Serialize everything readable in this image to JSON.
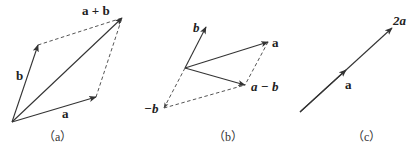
{
  "figure": {
    "panels": [
      {
        "id": "a",
        "caption": "（a）",
        "labels": {
          "a": "a",
          "b": "b",
          "sum": "a + b"
        },
        "vectors": [
          {
            "name": "a",
            "from": [
              12,
              122
            ],
            "to": [
              96,
              97
            ],
            "style": "solid"
          },
          {
            "name": "b",
            "from": [
              12,
              122
            ],
            "to": [
              38,
              45
            ],
            "style": "solid"
          },
          {
            "name": "a+b",
            "from": [
              12,
              122
            ],
            "to": [
              122,
              18
            ],
            "style": "solid"
          }
        ],
        "dashed": [
          {
            "from": [
              38,
              45
            ],
            "to": [
              122,
              18
            ]
          },
          {
            "from": [
              96,
              97
            ],
            "to": [
              122,
              18
            ]
          }
        ]
      },
      {
        "id": "b",
        "caption": "（b）",
        "labels": {
          "a": "a",
          "b": "b",
          "neg_b": "−b",
          "diff": "a − b"
        },
        "vectors": [
          {
            "name": "b",
            "from": [
              185,
              68
            ],
            "to": [
              206,
              27
            ],
            "style": "solid"
          },
          {
            "name": "a",
            "from": [
              185,
              68
            ],
            "to": [
              268,
              42
            ],
            "style": "solid"
          },
          {
            "name": "a-b",
            "from": [
              185,
              68
            ],
            "to": [
              245,
              85
            ],
            "style": "solid"
          },
          {
            "name": "-b",
            "from": [
              185,
              68
            ],
            "to": [
              164,
              108
            ],
            "style": "dashed"
          }
        ],
        "dashed": [
          {
            "from": [
              164,
              108
            ],
            "to": [
              245,
              85
            ]
          },
          {
            "from": [
              268,
              42
            ],
            "to": [
              245,
              85
            ]
          }
        ]
      },
      {
        "id": "c",
        "caption": "（c）",
        "labels": {
          "a": "a",
          "two_a": "2a"
        },
        "vectors": [
          {
            "name": "2a",
            "from": [
              300,
              112
            ],
            "to": [
              392,
              28
            ],
            "style": "solid"
          },
          {
            "name": "a",
            "from": [
              300,
              112
            ],
            "to": [
              346,
              70
            ],
            "style": "solid"
          }
        ]
      }
    ]
  }
}
